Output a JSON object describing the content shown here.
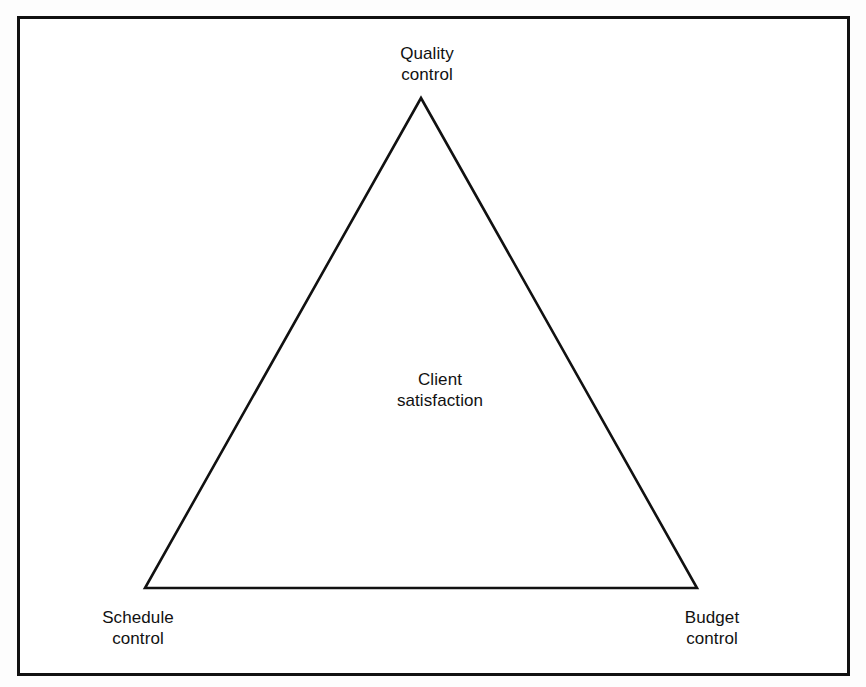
{
  "figure": {
    "kind": "triangle-diagram",
    "title_visible": false,
    "frame": {
      "border_color": "#111111",
      "fill_color": "#ffffff",
      "border_width_px": 3
    },
    "page_background": "#fdfdfd"
  },
  "triangle": {
    "stroke_color": "#111111",
    "stroke_width_px": 2.6,
    "fill": "none",
    "vertices": {
      "apex": {
        "x": 421,
        "y": 98
      },
      "bottom_left": {
        "x": 145,
        "y": 588
      },
      "bottom_right": {
        "x": 697,
        "y": 588
      }
    },
    "points_attr": "421,98 145,588 697,588"
  },
  "labels": {
    "apex": "Quality\ncontrol",
    "center": "Client\nsatisfaction",
    "bottom_left": "Schedule\ncontrol",
    "bottom_right": "Budget\ncontrol"
  },
  "text_style": {
    "color": "#111111",
    "font_size_px": 17,
    "line_height_px": 21
  }
}
